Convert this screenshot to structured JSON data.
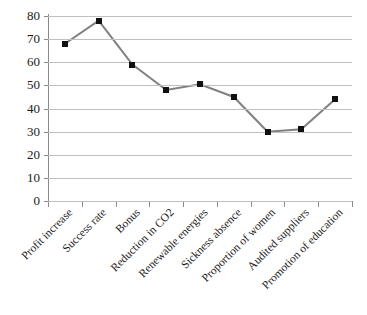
{
  "chart_data": {
    "type": "line",
    "title": "",
    "subtitle": "",
    "xlabel": "",
    "ylabel": "",
    "categories": [
      "Profit increase",
      "Success rate",
      "Bonus",
      "Reduction in CO2",
      "Renewable energies",
      "Sickness absence",
      "Proportion of women",
      "Audited suppliers",
      "Promotion of education"
    ],
    "values": [
      68,
      78,
      59,
      48,
      50.5,
      45,
      30,
      31,
      44
    ],
    "series": [
      {
        "name": "",
        "values": [
          68,
          78,
          59,
          48,
          50.5,
          45,
          30,
          31,
          44
        ]
      }
    ],
    "ylim": [
      0,
      80
    ],
    "yticks": [
      0,
      10,
      20,
      30,
      40,
      50,
      60,
      70,
      80
    ],
    "ytick_labels": [
      "0",
      "10",
      "20",
      "30",
      "40",
      "50",
      "60",
      "70",
      "80"
    ],
    "grid": true,
    "grid_axis": "y",
    "legend": false,
    "legend_position": "none",
    "marker": "square",
    "marker_color": "#111111",
    "line_color": "#808080",
    "gridline_color": "#bfbfbf",
    "axis_color": "#8a8a8a",
    "background_color": "#ffffff",
    "text_color": "#1a1a1a"
  }
}
